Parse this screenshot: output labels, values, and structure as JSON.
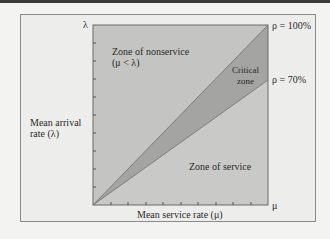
{
  "diagram": {
    "axes": {
      "y_symbol": "λ",
      "x_symbol": "μ",
      "y_label_line1": "Mean arrival",
      "y_label_line2": "rate (λ)",
      "x_label": "Mean service rate (μ)"
    },
    "zones": {
      "nonservice_line1": "Zone of nonservice",
      "nonservice_line2": "(μ < λ)",
      "critical_line1": "Critical",
      "critical_line2": "zone",
      "service": "Zone of service"
    },
    "lines": {
      "rho_100": "ρ = 100%",
      "rho_70": "ρ = 70%"
    },
    "colors": {
      "nonservice_fill": "#c4c4c2",
      "critical_fill": "#a3a3a1",
      "service_fill": "#c9c9c7",
      "frame_bg": "#ededeb"
    },
    "y_ticks": 9,
    "x_ticks": 9
  }
}
